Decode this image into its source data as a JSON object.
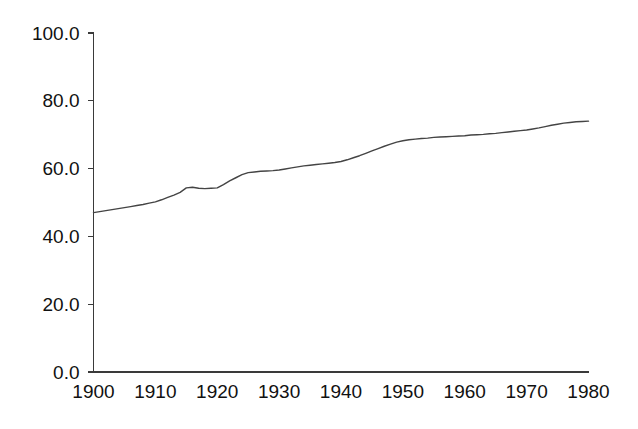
{
  "chart_data": {
    "type": "line",
    "title": "",
    "subtitle": "",
    "xlabel": "",
    "ylabel": "",
    "xlim": [
      1900,
      1980
    ],
    "ylim": [
      0,
      100
    ],
    "grid": false,
    "legend": null,
    "legend_position": "none",
    "x_tick_labels": [
      "1900",
      "1910",
      "1920",
      "1930",
      "1940",
      "1950",
      "1960",
      "1970",
      "1980"
    ],
    "x_ticks": [
      1900,
      1910,
      1920,
      1930,
      1940,
      1950,
      1960,
      1970,
      1980
    ],
    "y_tick_labels": [
      "0.0",
      "20.0",
      "40.0",
      "60.0",
      "80.0",
      "100.0"
    ],
    "y_ticks": [
      0,
      20,
      40,
      60,
      80,
      100
    ],
    "line_color": "#444444",
    "axis_color": "#3a3a3a",
    "background_color": "#ffffff",
    "series": [
      {
        "name": "series-1",
        "x": [
          1900,
          1901,
          1902,
          1903,
          1904,
          1905,
          1906,
          1907,
          1908,
          1909,
          1910,
          1911,
          1912,
          1913,
          1914,
          1915,
          1916,
          1917,
          1918,
          1919,
          1920,
          1921,
          1922,
          1923,
          1924,
          1925,
          1926,
          1927,
          1928,
          1929,
          1930,
          1931,
          1932,
          1933,
          1934,
          1935,
          1936,
          1937,
          1938,
          1939,
          1940,
          1941,
          1942,
          1943,
          1944,
          1945,
          1946,
          1947,
          1948,
          1949,
          1950,
          1951,
          1952,
          1953,
          1954,
          1955,
          1956,
          1957,
          1958,
          1959,
          1960,
          1961,
          1962,
          1963,
          1964,
          1965,
          1966,
          1967,
          1968,
          1969,
          1970,
          1971,
          1972,
          1973,
          1974,
          1975,
          1976,
          1977,
          1978,
          1979,
          1980
        ],
        "values": [
          47.0,
          47.3,
          47.6,
          47.9,
          48.2,
          48.5,
          48.8,
          49.1,
          49.4,
          49.8,
          50.2,
          50.8,
          51.5,
          52.2,
          53.0,
          54.3,
          54.5,
          54.2,
          54.1,
          54.2,
          54.3,
          55.3,
          56.4,
          57.3,
          58.2,
          58.8,
          59.0,
          59.2,
          59.3,
          59.4,
          59.6,
          59.9,
          60.2,
          60.5,
          60.8,
          61.0,
          61.2,
          61.4,
          61.6,
          61.8,
          62.1,
          62.6,
          63.2,
          63.8,
          64.5,
          65.2,
          65.9,
          66.6,
          67.2,
          67.8,
          68.2,
          68.5,
          68.7,
          68.9,
          69.0,
          69.2,
          69.3,
          69.4,
          69.5,
          69.6,
          69.7,
          69.9,
          70.0,
          70.1,
          70.3,
          70.4,
          70.6,
          70.8,
          71.0,
          71.2,
          71.4,
          71.7,
          72.0,
          72.4,
          72.8,
          73.1,
          73.4,
          73.6,
          73.8,
          73.9,
          74.0
        ]
      }
    ]
  },
  "axes": {
    "y_axis_name": "y-axis",
    "x_axis_name": "x-axis"
  }
}
